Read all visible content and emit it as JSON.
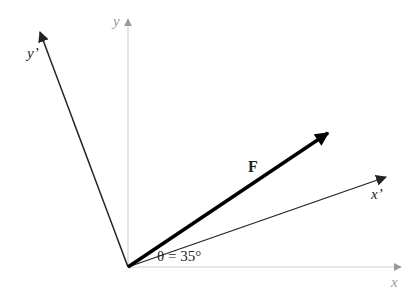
{
  "labels": {
    "y": "y",
    "y_prime": "y’",
    "x": "x",
    "x_prime": "x’",
    "force": "F",
    "angle": "θ = 35°"
  },
  "colors": {
    "axis": "#c8c8c8",
    "axis_arrow": "#999999",
    "rotated_axis": "#222222",
    "force": "#000000"
  }
}
